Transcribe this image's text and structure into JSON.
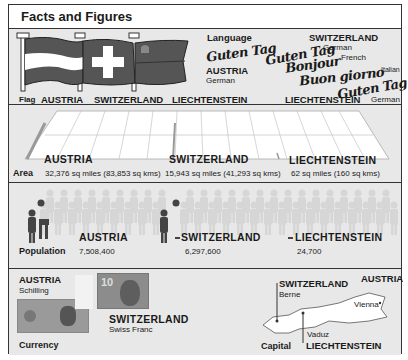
{
  "title": "Facts and Figures",
  "flag": {
    "label": "Flag",
    "countries": [
      "AUSTRIA",
      "SWITZERLAND",
      "LIECHTENSTEIN"
    ]
  },
  "language": {
    "label": "Language",
    "austria": {
      "name": "AUSTRIA",
      "greeting": "Guten Tag",
      "language": "German"
    },
    "switzerland": {
      "name": "SWITZERLAND",
      "greetings": [
        {
          "text": "Guten Tag",
          "language": "German"
        },
        {
          "text": "Bonjour",
          "language": "French"
        },
        {
          "text": "Buon giorno",
          "language": "Italian"
        }
      ]
    },
    "liechtenstein": {
      "name": "LIECHTENSTEIN",
      "greeting": "Guten Tag",
      "language": "German"
    }
  },
  "area": {
    "label": "Area",
    "items": [
      {
        "country": "AUSTRIA",
        "value": "32,376 sq miles (83,853 sq kms)"
      },
      {
        "country": "SWITZERLAND",
        "value": "15,943 sq miles (41,293 sq kms)"
      },
      {
        "country": "LIECHTENSTEIN",
        "value": "62 sq miles (160 sq kms)"
      }
    ]
  },
  "population": {
    "label": "Population",
    "items": [
      {
        "country": "AUSTRIA",
        "value": "7,508,400"
      },
      {
        "country": "SWITZERLAND",
        "value": "6,297,600"
      },
      {
        "country": "LIECHTENSTEIN",
        "value": "24,700"
      }
    ]
  },
  "currency": {
    "label": "Currency",
    "items": [
      {
        "country": "AUSTRIA",
        "name": "Schilling"
      },
      {
        "country": "SWITZERLAND",
        "name": "Swiss Franc",
        "note_value": "10"
      }
    ]
  },
  "capital": {
    "label": "Capital",
    "items": [
      {
        "country": "SWITZERLAND",
        "city": "Berne"
      },
      {
        "country": "AUSTRIA",
        "city": "Vienna"
      },
      {
        "country": "LIECHTENSTEIN",
        "city": "Vaduz"
      }
    ]
  }
}
